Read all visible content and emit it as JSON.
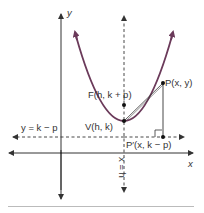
{
  "diagram": {
    "type": "parabola-definition",
    "colors": {
      "parabola": "#6b3a5a",
      "lines": "#333333",
      "background": "#ffffff"
    },
    "axes": {
      "x_label": "x",
      "y_label": "y"
    },
    "labels": {
      "focus": "F(h, k + p)",
      "point": "P(x, y)",
      "vertex": "V(h, k)",
      "directrix": "y = k − p",
      "projection": "P′(x, k − p)",
      "axis_of_symmetry": "x = h"
    }
  }
}
